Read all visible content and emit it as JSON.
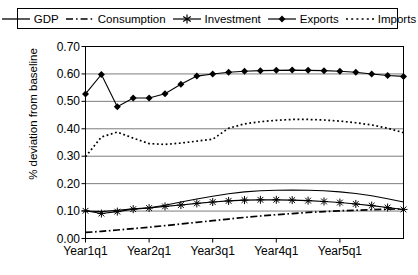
{
  "chart_data": {
    "type": "line",
    "title": "",
    "xlabel": "",
    "ylabel": "% deviation from baseline",
    "ylim": [
      0.0,
      0.7
    ],
    "yticks": [
      "0.00",
      "0.10",
      "0.20",
      "0.30",
      "0.40",
      "0.50",
      "0.60",
      "0.70"
    ],
    "ytick_values": [
      0.0,
      0.1,
      0.2,
      0.3,
      0.4,
      0.5,
      0.6,
      0.7
    ],
    "xticks": [
      "Year1q1",
      "Year2q1",
      "Year3q1",
      "Year4q1",
      "Year5q1"
    ],
    "xtick_indices": [
      0,
      4,
      8,
      12,
      16
    ],
    "x": [
      0,
      1,
      2,
      3,
      4,
      5,
      6,
      7,
      8,
      9,
      10,
      11,
      12,
      13,
      14,
      15,
      16,
      17,
      18,
      19,
      20
    ],
    "grid": "horizontal",
    "legend_position": "top",
    "series": [
      {
        "name": "GDP",
        "style": "solid",
        "marker": "none",
        "color": "#000000",
        "values": [
          0.1,
          0.098,
          0.103,
          0.108,
          0.112,
          0.121,
          0.133,
          0.144,
          0.154,
          0.163,
          0.17,
          0.174,
          0.176,
          0.177,
          0.176,
          0.174,
          0.17,
          0.164,
          0.156,
          0.145,
          0.133
        ]
      },
      {
        "name": "Consumption",
        "style": "dash-dot",
        "marker": "none",
        "color": "#000000",
        "values": [
          0.022,
          0.026,
          0.031,
          0.036,
          0.041,
          0.047,
          0.053,
          0.059,
          0.065,
          0.071,
          0.077,
          0.082,
          0.087,
          0.091,
          0.095,
          0.098,
          0.101,
          0.103,
          0.105,
          0.107,
          0.108
        ]
      },
      {
        "name": "Investment",
        "style": "solid",
        "marker": "asterisk",
        "color": "#000000",
        "values": [
          0.101,
          0.091,
          0.098,
          0.107,
          0.111,
          0.117,
          0.122,
          0.128,
          0.133,
          0.137,
          0.14,
          0.141,
          0.141,
          0.14,
          0.138,
          0.135,
          0.131,
          0.126,
          0.12,
          0.113,
          0.106
        ]
      },
      {
        "name": "Exports",
        "style": "solid",
        "marker": "diamond",
        "color": "#000000",
        "values": [
          0.527,
          0.598,
          0.48,
          0.512,
          0.512,
          0.528,
          0.562,
          0.592,
          0.6,
          0.606,
          0.61,
          0.612,
          0.613,
          0.614,
          0.613,
          0.612,
          0.61,
          0.606,
          0.6,
          0.594,
          0.591
        ]
      },
      {
        "name": "Imports",
        "style": "dotted",
        "marker": "none",
        "color": "#000000",
        "values": [
          0.298,
          0.37,
          0.388,
          0.366,
          0.346,
          0.343,
          0.348,
          0.355,
          0.362,
          0.402,
          0.418,
          0.426,
          0.431,
          0.434,
          0.434,
          0.432,
          0.428,
          0.422,
          0.414,
          0.402,
          0.386
        ]
      }
    ]
  },
  "legend": {
    "items": [
      {
        "label": "GDP",
        "swatch": "line-solid"
      },
      {
        "label": "Consumption",
        "swatch": "line-dash-dot"
      },
      {
        "label": "Investment",
        "swatch": "line-asterisk"
      },
      {
        "label": "Exports",
        "swatch": "line-diamond"
      },
      {
        "label": "Imports",
        "swatch": "line-dotted"
      }
    ]
  }
}
